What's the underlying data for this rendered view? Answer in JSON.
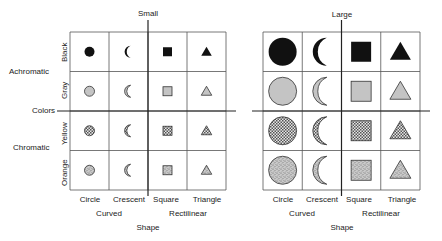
{
  "panels": [
    {
      "id": "small",
      "title": "Small",
      "size": "small",
      "grid": {
        "x": 70,
        "y": 32,
        "col_w": 39,
        "row_h": 39.5
      },
      "row_labels": [
        "Black",
        "Gray",
        "Yellow",
        "Orange"
      ],
      "column_labels": [
        "Circle",
        "Crescent",
        "Square",
        "Triangle"
      ],
      "column_group_labels": [
        "Curved",
        "Rectilinear"
      ],
      "x_axis_title": "Shape"
    },
    {
      "id": "large",
      "title": "Large",
      "size": "large",
      "grid": {
        "x": 263,
        "y": 32,
        "col_w": 39.25,
        "row_h": 39.5
      },
      "row_labels": [],
      "column_labels": [
        "Circle",
        "Crescent",
        "Square",
        "Triangle"
      ],
      "column_group_labels": [
        "Curved",
        "Rectilinear"
      ],
      "x_axis_title": "Shape"
    }
  ],
  "row_group_labels": [
    "Achromatic",
    "Chromatic"
  ],
  "y_axis_title": "Colors",
  "shapes": [
    "circle",
    "crescent",
    "square",
    "triangle"
  ],
  "colors": [
    {
      "name": "Black",
      "fill": "black",
      "hex": "#111111"
    },
    {
      "name": "Gray",
      "fill": "gray",
      "hex": "#c4c4c4"
    },
    {
      "name": "Yellow",
      "fill": "crosshatch",
      "hex": "#9a9a9a"
    },
    {
      "name": "Orange",
      "fill": "stipple",
      "hex": "#b0b0b0"
    }
  ],
  "style": {
    "line_color": "#333333",
    "outline_color": "#333333"
  }
}
